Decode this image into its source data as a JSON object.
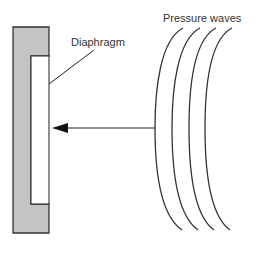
{
  "diagram": {
    "labels": {
      "diaphragm": "Diaphragm",
      "pressure_waves": "Pressure waves"
    },
    "colors": {
      "housing_fill": "#c4c4c4",
      "stroke": "#333333",
      "diaphragm_fill": "#ffffff",
      "background": "#ffffff"
    },
    "wave_count": 4
  }
}
